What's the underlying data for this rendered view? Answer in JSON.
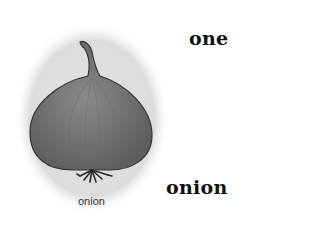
{
  "words": {
    "top": "one",
    "bottom": "onion"
  },
  "illustration": {
    "subject": "onion",
    "caption": "onion"
  },
  "colors": {
    "halo": "#e2e2e2",
    "bulb": "#7a7a7a",
    "outline": "#333333",
    "text": "#111111"
  }
}
